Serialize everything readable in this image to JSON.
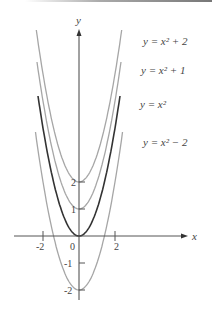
{
  "chart_data": {
    "type": "line",
    "title": "",
    "xlabel": "x",
    "ylabel": "y",
    "x_ticks": [
      "-2",
      "0",
      "2"
    ],
    "y_ticks": [
      "2",
      "1",
      "-1",
      "-2"
    ],
    "xlim": [
      -4.3,
      4
    ],
    "ylim": [
      -2.7,
      8.2
    ],
    "grid": false,
    "legend_position": "inline-right",
    "series": [
      {
        "name": "y = x² + 2",
        "shift": 2,
        "color": "#a6a6a6"
      },
      {
        "name": "y = x² + 1",
        "shift": 1,
        "color": "#a6a6a6"
      },
      {
        "name": "y = x²",
        "shift": 0,
        "color": "#333333"
      },
      {
        "name": "y = x² − 2",
        "shift": -2,
        "color": "#a6a6a6"
      }
    ]
  },
  "labels": {
    "x_axis": "x",
    "y_axis": "y",
    "curve_plus2": "y = x² + 2",
    "curve_plus1": "y = x² + 1",
    "curve_zero": "y = x²",
    "curve_minus2": "y = x² − 2"
  }
}
